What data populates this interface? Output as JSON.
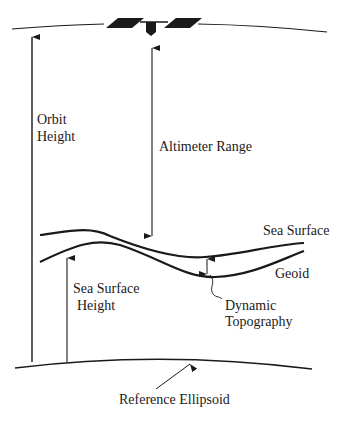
{
  "diagram": {
    "labels": {
      "orbit_height_line1": "Orbit",
      "orbit_height_line2": "Height",
      "altimeter_range": "Altimeter Range",
      "sea_surface": "Sea Surface",
      "geoid": "Geoid",
      "sea_surface_height_line1": "Sea Surface",
      "sea_surface_height_line2": "Height",
      "dynamic_topography_line1": "Dynamic",
      "dynamic_topography_line2": "Topography",
      "reference_ellipsoid": "Reference Ellipsoid"
    },
    "icons": {
      "satellite": "satellite-icon"
    },
    "colors": {
      "ink": "#1a1a1a",
      "background": "#ffffff"
    }
  }
}
